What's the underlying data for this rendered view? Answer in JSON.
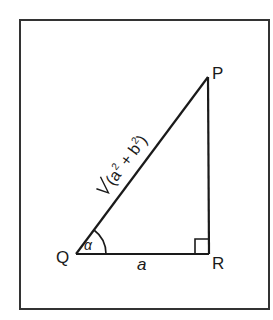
{
  "diagram": {
    "type": "right-triangle",
    "vertices": {
      "P": {
        "label": "P"
      },
      "Q": {
        "label": "Q"
      },
      "R": {
        "label": "R"
      }
    },
    "angle_label": "α",
    "base_label": "a",
    "hypotenuse_label": {
      "radical": "√",
      "open": "(a",
      "sup1": "2",
      "plus": " + b",
      "sup2": "2",
      "close": ")"
    },
    "right_angle_at": "R",
    "colors": {
      "stroke": "#1a1a1a",
      "background": "#ffffff"
    }
  }
}
